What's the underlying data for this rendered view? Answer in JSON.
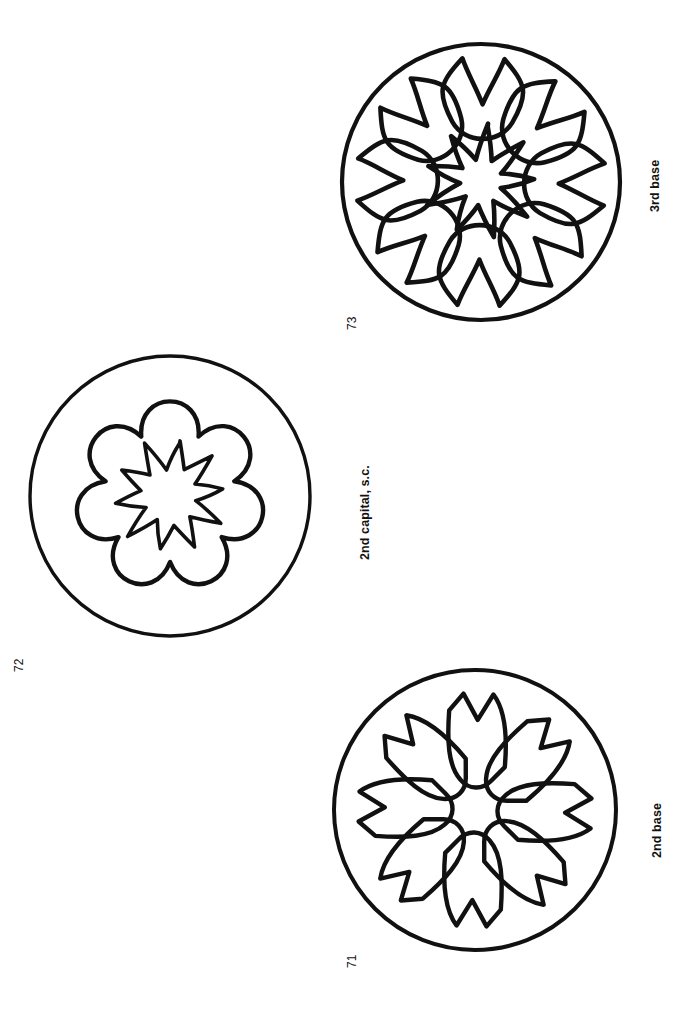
{
  "page": {
    "background_color": "#ffffff",
    "ink_color": "#111111",
    "width": 689,
    "height": 1036,
    "orientation": "rotated-90-ccw"
  },
  "figures": [
    {
      "id": "73",
      "number": "73",
      "caption": "3rd base",
      "center_x": 480,
      "center_y": 181,
      "outer_radius": 138,
      "petal_count": 8,
      "petal_style": "crescent-horseshoe",
      "star_points": 9,
      "star_outer_radius": 56,
      "star_inner_radius": 22
    },
    {
      "id": "72",
      "number": "72",
      "caption": "2nd capital, s.c.",
      "center_x": 170,
      "center_y": 496,
      "outer_radius": 140,
      "petal_count": 7,
      "petal_style": "rounded-lobe",
      "star_points": 10,
      "star_outer_radius": 56,
      "star_inner_radius": 28
    },
    {
      "id": "71",
      "number": "71",
      "caption": "2nd base",
      "center_x": 475,
      "center_y": 810,
      "outer_radius": 141,
      "petal_count": 8,
      "petal_style": "forked-notched",
      "star_points": 0,
      "star_outer_radius": 0,
      "star_inner_radius": 0
    }
  ]
}
